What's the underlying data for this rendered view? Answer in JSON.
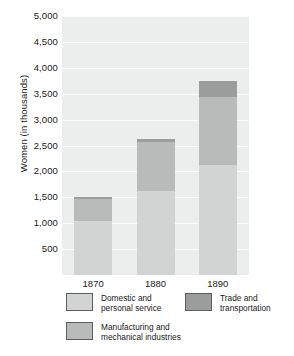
{
  "chart_data": {
    "type": "bar",
    "subtype": "stacked-bar",
    "title": "",
    "xlabel": "",
    "ylabel": "Women (in thousands)",
    "categories": [
      "1870",
      "1880",
      "1890"
    ],
    "ylim": [
      0,
      5000
    ],
    "ytick_values": [
      500,
      1000,
      1500,
      2000,
      2500,
      3000,
      3500,
      4000,
      4500,
      5000
    ],
    "ytick_labels": [
      "500",
      "1,000",
      "1,500",
      "2,000",
      "2,500",
      "3,000",
      "3,500",
      "4,000",
      "4,500",
      "5,000"
    ],
    "grid": true,
    "grid_axis": "y",
    "legend_position": "below",
    "series": [
      {
        "name": "Domestic and\npersonal service",
        "color": "#d2d3d3",
        "values": [
          1050,
          1625,
          2125
        ]
      },
      {
        "name": "Manufacturing and\nmechanical industries",
        "color": "#b9bbbb",
        "values": [
          420,
          950,
          1305
        ]
      },
      {
        "name": "Trade and\ntransportation",
        "color": "#9b9d9d",
        "values": [
          30,
          50,
          320
        ]
      }
    ],
    "totals": [
      1500,
      2625,
      3750
    ],
    "plot_background": "#eceded",
    "gridline_color": "#fdfdfd"
  },
  "legend": {
    "items": [
      {
        "label": "Domestic and\npersonal service",
        "color": "#d2d3d3"
      },
      {
        "label": "Manufacturing and\nmechanical industries",
        "color": "#b9bbbb"
      },
      {
        "label": "Trade and\ntransportation",
        "color": "#9b9d9d"
      }
    ]
  }
}
